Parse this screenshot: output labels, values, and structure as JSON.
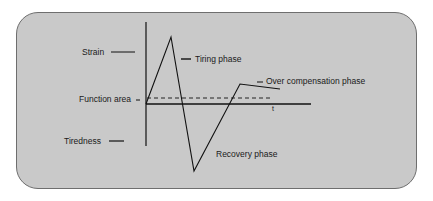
{
  "diagram": {
    "type": "supercompensation-curve",
    "labels": {
      "strain": "Strain",
      "function_area": "Function area",
      "tiredness": "Tiredness",
      "tiring_phase": "Tiring phase",
      "recovery_phase": "Recovery phase",
      "over_compensation_phase": "Over compensation phase",
      "time_axis": "t"
    },
    "colors": {
      "panel_bg": "#c9c9c9",
      "panel_border": "#6e6e6e",
      "line": "#111111"
    }
  }
}
